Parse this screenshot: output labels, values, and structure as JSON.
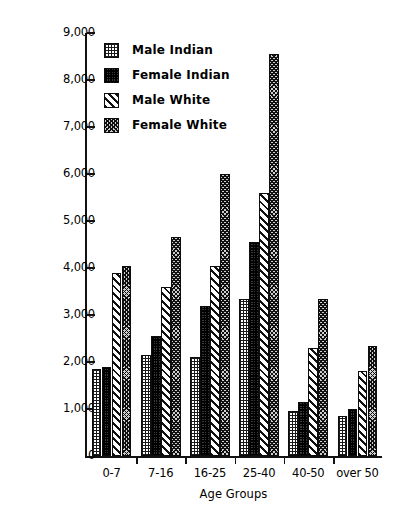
{
  "chart_data": {
    "type": "bar",
    "title": "",
    "xlabel": "Age Groups",
    "ylabel": "",
    "categories": [
      "0-7",
      "7-16",
      "16-25",
      "25-40",
      "40-50",
      "over 50"
    ],
    "ylim": [
      0,
      9000
    ],
    "ytick_values": [
      0,
      1000,
      2000,
      3000,
      4000,
      5000,
      6000,
      7000,
      8000,
      9000
    ],
    "ytick_labels": [
      "0",
      "1,000",
      "2,000",
      "3,000",
      "4,000",
      "5,000",
      "6,000",
      "7,000",
      "8,000",
      "9,000"
    ],
    "grid": false,
    "legend_position": "top-left-inside",
    "series": [
      {
        "name": "Male Indian",
        "pattern": "fine-grid",
        "values": [
          1850,
          2150,
          2100,
          3350,
          950,
          850
        ]
      },
      {
        "name": "Female Indian",
        "pattern": "dense-dark-checker",
        "values": [
          1900,
          2550,
          3200,
          4550,
          1150,
          1000
        ]
      },
      {
        "name": "Male White",
        "pattern": "diagonal-stripes",
        "values": [
          3900,
          3600,
          4050,
          5600,
          2300,
          1800
        ]
      },
      {
        "name": "Female White",
        "pattern": "crosshatch",
        "values": [
          4050,
          4650,
          6000,
          8550,
          3350,
          2350
        ]
      }
    ]
  },
  "colors": {
    "ink": "#121212",
    "background": "#ffffff"
  }
}
